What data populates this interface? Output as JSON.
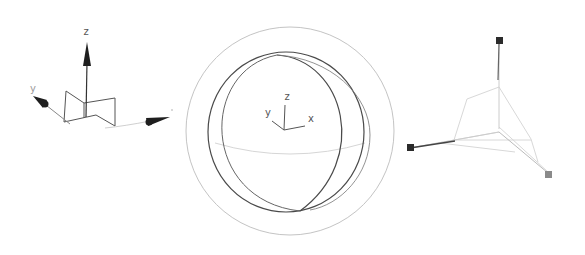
{
  "figure": {
    "background": "#ffffff",
    "gizmos": [
      {
        "name": "move-gizmo",
        "axis_labels": {
          "z": "z",
          "y": "y"
        },
        "colors": {
          "arrow": "#1e1e1e",
          "line": "#777777",
          "light": "#c8c8c8"
        }
      },
      {
        "name": "rotate-gizmo",
        "axis_labels": {
          "z": "z",
          "y": "y",
          "x": "x"
        },
        "colors": {
          "outer_ring": "#c4c4c4",
          "sphere_ring": "#4a4a4a",
          "equator": "#d6d6d6",
          "axes": "#555555"
        }
      },
      {
        "name": "scale-gizmo",
        "colors": {
          "handle_dark": "#2b2b2b",
          "handle_gray": "#8a8a8a",
          "line": "#d0d0d0",
          "axis_dark": "#444444"
        }
      }
    ]
  }
}
